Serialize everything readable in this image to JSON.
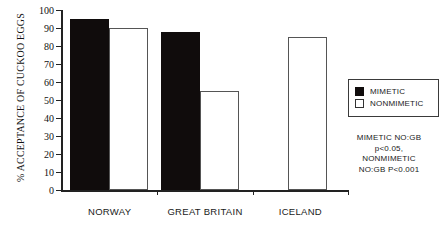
{
  "chart_data": {
    "type": "bar",
    "title": "",
    "xlabel": "",
    "ylabel": "% ACCEPTANCE OF CUCKOO EGGS",
    "ylim": [
      0,
      100
    ],
    "yticks": [
      0,
      10,
      20,
      30,
      40,
      50,
      60,
      70,
      80,
      90,
      100
    ],
    "ytick_labels": [
      "0",
      "10",
      "20",
      "30",
      "40",
      "50",
      "60",
      "70",
      "80",
      "90",
      "100"
    ],
    "grid": false,
    "legend_position": "right",
    "categories": [
      "NORWAY",
      "GREAT BRITAIN",
      "ICELAND"
    ],
    "series": [
      {
        "name": "MIMETIC",
        "color": "#100c0c",
        "values": [
          95,
          88,
          0
        ]
      },
      {
        "name": "NONMIMETIC",
        "color": "#ffffff",
        "values": [
          90,
          55,
          85
        ]
      }
    ],
    "annotations": [
      "MIMETIC NO:GB",
      "p<0.05,",
      "NONMIMETIC",
      "NO:GB P<0.001"
    ]
  },
  "legend": {
    "entries": [
      {
        "label": "MIMETIC",
        "swatch": "filled-square-icon"
      },
      {
        "label": "NONMIMETIC",
        "swatch": "open-square-icon"
      }
    ]
  },
  "colors": {
    "mimetic": "#100c0c",
    "nonmimetic": "#ffffff",
    "axis": "#222222",
    "background": "#ffffff"
  }
}
